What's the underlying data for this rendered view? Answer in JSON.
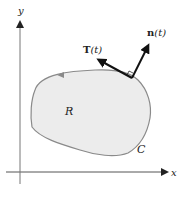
{
  "diagram": {
    "type": "vector field on closed curve",
    "axes": {
      "x_label": "x",
      "y_label": "y"
    },
    "region": {
      "label": "R",
      "fill": "#ececec",
      "stroke": "#8a8a8a"
    },
    "curve": {
      "label": "C",
      "orientation": "counterclockwise"
    },
    "vectors": {
      "tangent": {
        "name": "T",
        "arg": "(t)",
        "label": "T(t)"
      },
      "normal": {
        "name": "n",
        "arg": "(t)",
        "label": "n(t)"
      }
    },
    "colors": {
      "axis": "#555555",
      "vector": "#111111",
      "region_fill": "#ececec",
      "region_stroke": "#8a8a8a"
    }
  }
}
